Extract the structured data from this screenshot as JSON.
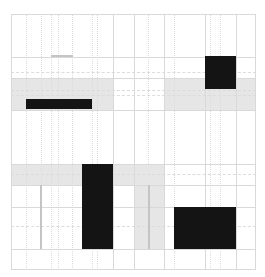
{
  "diagram": {
    "type": "grid-block-pattern",
    "width": 265,
    "height": 277,
    "colors": {
      "background": "#ffffff",
      "grid_line": "#d9d9d9",
      "dotted_line": "#dcdcdc",
      "band_fill": "#e6e6e6",
      "strip_line": "#c4c4c4",
      "block_fill": "#141414",
      "accent_line": "#b0b0b0"
    },
    "outer_frame": {
      "x": 11,
      "y": 14,
      "w": 245,
      "h": 256
    },
    "vertical_lines": [
      113,
      134,
      164,
      205,
      236
    ],
    "horizontal_lines": [
      57,
      78,
      110,
      164,
      185,
      207,
      249
    ],
    "dotted_verticals": [
      {
        "x": 26,
        "y1": 14,
        "y2": 270
      },
      {
        "x": 41,
        "y1": 14,
        "y2": 185
      },
      {
        "x": 51,
        "y1": 14,
        "y2": 270
      },
      {
        "x": 58,
        "y1": 14,
        "y2": 270
      },
      {
        "x": 72,
        "y1": 14,
        "y2": 270
      },
      {
        "x": 92,
        "y1": 14,
        "y2": 270
      },
      {
        "x": 97,
        "y1": 14,
        "y2": 270
      },
      {
        "x": 148,
        "y1": 14,
        "y2": 164
      },
      {
        "x": 174,
        "y1": 14,
        "y2": 270
      },
      {
        "x": 210,
        "y1": 14,
        "y2": 270
      },
      {
        "x": 220,
        "y1": 14,
        "y2": 270
      }
    ],
    "dashed_horizontals": [
      72,
      90,
      95,
      174,
      226
    ],
    "bands": [
      {
        "name": "upper-band-left",
        "x": 11,
        "y": 78,
        "w": 102,
        "h": 32
      },
      {
        "name": "upper-band-right",
        "x": 164,
        "y": 78,
        "w": 92,
        "h": 32
      },
      {
        "name": "lower-band",
        "x": 11,
        "y": 164,
        "w": 153,
        "h": 21
      },
      {
        "name": "vertical-strip",
        "x": 134,
        "y": 164,
        "w": 30,
        "h": 85
      }
    ],
    "accent_lines": [
      {
        "name": "short-top-line",
        "x": 51,
        "y": 55,
        "w": 22,
        "h": 2
      },
      {
        "name": "strip-center-line",
        "x": 148,
        "y": 185,
        "w": 2,
        "h": 64
      },
      {
        "name": "left-vertical-line",
        "x": 40,
        "y": 185,
        "w": 2,
        "h": 64
      }
    ],
    "blocks": [
      {
        "name": "black-block-top-right",
        "x": 205,
        "y": 56,
        "w": 31,
        "h": 33
      },
      {
        "name": "black-bar-left",
        "x": 26,
        "y": 99,
        "w": 66,
        "h": 10
      },
      {
        "name": "black-column-center",
        "x": 82,
        "y": 164,
        "w": 31,
        "h": 85
      },
      {
        "name": "black-block-bottom-right",
        "x": 174,
        "y": 207,
        "w": 62,
        "h": 42
      }
    ]
  }
}
